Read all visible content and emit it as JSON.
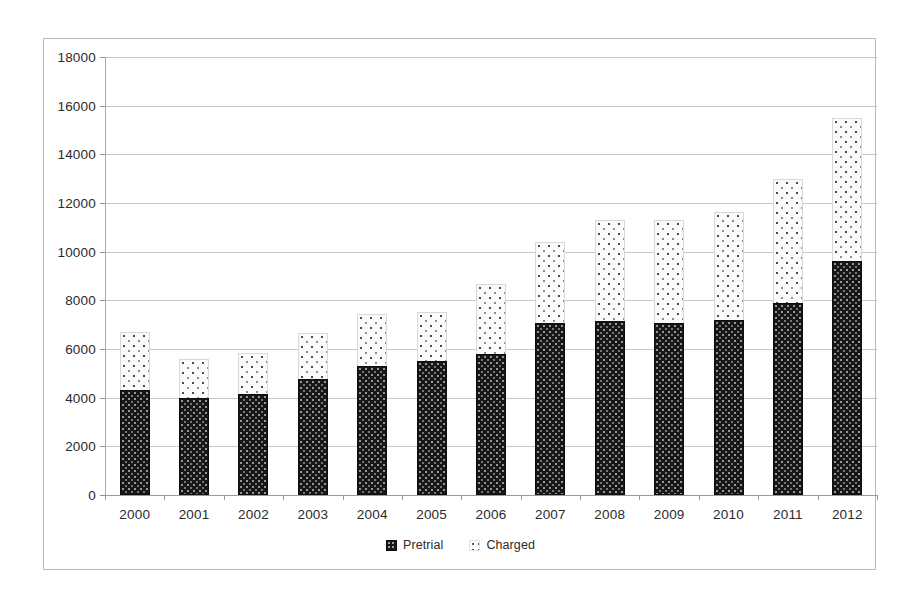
{
  "chart_data": {
    "type": "bar",
    "subtype": "stacked-vertical",
    "title": "",
    "xlabel": "",
    "ylabel": "",
    "categories": [
      "2000",
      "2001",
      "2002",
      "2003",
      "2004",
      "2005",
      "2006",
      "2007",
      "2008",
      "2009",
      "2010",
      "2011",
      "2012"
    ],
    "series": [
      {
        "name": "Pretrial",
        "color": "#171717",
        "pattern": "dark-dotted",
        "values": [
          4300,
          3990,
          4150,
          4770,
          5300,
          5510,
          5790,
          7070,
          7150,
          7070,
          7190,
          7890,
          9620
        ]
      },
      {
        "name": "Charged",
        "color": "#fbfbfb",
        "pattern": "light-dotted",
        "values": [
          2400,
          1600,
          1690,
          1890,
          2140,
          2010,
          2880,
          3330,
          4150,
          4230,
          4440,
          5100,
          5870
        ]
      }
    ],
    "totals": [
      6700,
      5590,
      5840,
      6660,
      7440,
      7520,
      8670,
      10400,
      11300,
      11300,
      11630,
      12990,
      15490
    ],
    "ylim": [
      0,
      18000
    ],
    "y_ticks": [
      0,
      2000,
      4000,
      6000,
      8000,
      10000,
      12000,
      14000,
      16000,
      18000
    ],
    "y_tick_labels": [
      "0",
      "2000",
      "4000",
      "6000",
      "8000",
      "10000",
      "12000",
      "14000",
      "16000",
      "18000"
    ],
    "grid": true,
    "grid_axis": "y",
    "legend_position": "bottom-center",
    "legend_entries": [
      "Pretrial",
      "Charged"
    ]
  },
  "legend": {
    "items": [
      {
        "label": "Pretrial",
        "swatch": "dark-dotted-swatch-icon"
      },
      {
        "label": "Charged",
        "swatch": "light-dotted-swatch-icon"
      }
    ]
  }
}
